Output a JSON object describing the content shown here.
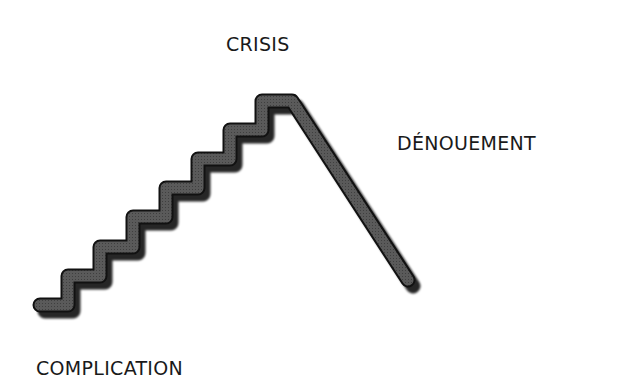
{
  "diagram": {
    "type": "plot-structure-staircase",
    "labels": {
      "crisis": "CRISIS",
      "denouement": "DÉNOUEMENT",
      "complication": "COMPLICATION"
    },
    "colors": {
      "stroke_fill": "#555555",
      "stroke_outline": "#111111",
      "shadow": "#000000",
      "text": "#1a1a1a",
      "background": "#ffffff"
    },
    "stages": [
      {
        "name": "complication",
        "position": "bottom-left",
        "shape": "rising staircase"
      },
      {
        "name": "crisis",
        "position": "peak",
        "shape": "plateau"
      },
      {
        "name": "denouement",
        "position": "right",
        "shape": "descending line"
      }
    ],
    "step_count": 7
  }
}
